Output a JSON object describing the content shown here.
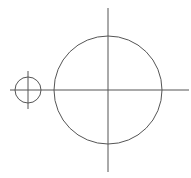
{
  "diagram": {
    "background": "#ffffff",
    "stroke_color": "#555555",
    "large_circle": {
      "cx": 108,
      "cy": 90,
      "r": 54
    },
    "small_circle": {
      "cx": 28,
      "cy": 90,
      "r": 13
    },
    "horizontal_axis": {
      "x1": 10,
      "y1": 90,
      "x2": 189,
      "y2": 90
    },
    "large_vertical_axis": {
      "x1": 108,
      "y1": 8,
      "x2": 108,
      "y2": 172
    },
    "small_vertical_axis": {
      "x1": 28,
      "y1": 71,
      "x2": 28,
      "y2": 109
    }
  }
}
